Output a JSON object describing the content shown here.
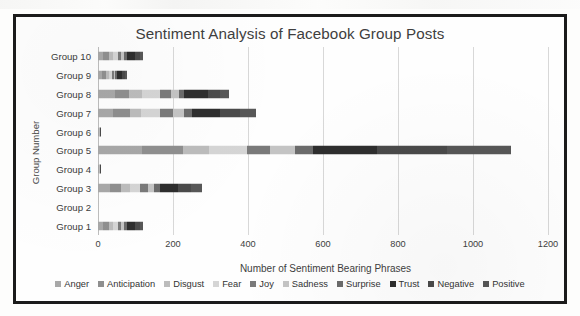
{
  "chart_data": {
    "type": "bar",
    "orientation": "horizontal",
    "stacked": true,
    "title": "Sentiment Analysis of Facebook Group Posts",
    "xlabel": "Number of Sentiment Bearing Phrases",
    "ylabel": "Group Number",
    "xlim": [
      0,
      1200
    ],
    "xticks": [
      0,
      200,
      400,
      600,
      800,
      1000,
      1200
    ],
    "xtick_labels": [
      "0",
      "200",
      "400",
      "600",
      "800",
      "1000",
      "1200"
    ],
    "grid": "vertical",
    "legend_position": "bottom",
    "categories": [
      "Group 10",
      "Group 9",
      "Group 8",
      "Group 7",
      "Group 6",
      "Group 5",
      "Group 4",
      "Group 3",
      "Group 2",
      "Group 1"
    ],
    "series": [
      {
        "name": "Anger",
        "color": "#a8a8a8",
        "values": [
          14,
          10,
          46,
          40,
          2,
          118,
          2,
          32,
          0,
          14
        ]
      },
      {
        "name": "Anticipation",
        "color": "#8f8f8f",
        "values": [
          16,
          12,
          36,
          44,
          1,
          108,
          1,
          30,
          0,
          16
        ]
      },
      {
        "name": "Disgust",
        "color": "#bcbcbc",
        "values": [
          10,
          8,
          34,
          30,
          1,
          70,
          1,
          24,
          0,
          10
        ]
      },
      {
        "name": "Fear",
        "color": "#d5d5d5",
        "values": [
          12,
          6,
          48,
          52,
          1,
          100,
          1,
          26,
          0,
          12
        ]
      },
      {
        "name": "Joy",
        "color": "#7a7a7a",
        "values": [
          10,
          6,
          30,
          34,
          0,
          62,
          0,
          20,
          0,
          10
        ]
      },
      {
        "name": "Sadness",
        "color": "#c4c4c4",
        "values": [
          8,
          4,
          22,
          30,
          0,
          66,
          0,
          18,
          0,
          8
        ]
      },
      {
        "name": "Surprise",
        "color": "#6b6b6b",
        "values": [
          6,
          4,
          14,
          20,
          0,
          48,
          0,
          14,
          0,
          6
        ]
      },
      {
        "name": "Trust",
        "color": "#2e2e2e",
        "values": [
          22,
          14,
          62,
          74,
          1,
          172,
          1,
          48,
          0,
          22
        ]
      },
      {
        "name": "Negative",
        "color": "#4a4a4a",
        "values": [
          14,
          8,
          34,
          54,
          1,
          186,
          1,
          36,
          0,
          14
        ]
      },
      {
        "name": "Positive",
        "color": "#575757",
        "values": [
          8,
          6,
          24,
          42,
          0,
          170,
          0,
          30,
          0,
          8
        ]
      }
    ],
    "totals": [
      120,
      78,
      350,
      420,
      7,
      1100,
      7,
      278,
      0,
      120
    ]
  }
}
